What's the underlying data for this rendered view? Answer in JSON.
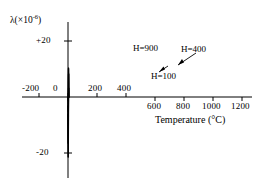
{
  "chart_data": {
    "type": "line",
    "title": "",
    "xlabel": "Temperature (°C)",
    "ylabel": "λ (×10⁻⁶)",
    "ylabel_symbol": "λ",
    "ylabel_factor": "(×10",
    "ylabel_exponent": "-6",
    "ylabel_close": ")",
    "xlim": [
      -260,
      1300
    ],
    "ylim": [
      -26,
      24
    ],
    "grid": false,
    "legend_position": "inline-annotations",
    "xticks": [
      -200,
      0,
      200,
      400,
      600,
      800,
      1000,
      1200
    ],
    "xticklabels": [
      "-200",
      "0",
      "200",
      "400",
      "600",
      "800",
      "1000",
      "1200"
    ],
    "xticklabel_above_axis": [
      true,
      true,
      true,
      true,
      false,
      false,
      false,
      false
    ],
    "yticks": [
      20,
      -20
    ],
    "yticklabels": [
      "+20",
      "-20"
    ],
    "series": [
      {
        "name": "H=900",
        "label": "H=900",
        "x": [
          -200,
          -150,
          -100,
          -50,
          0,
          60,
          120,
          180,
          230,
          270,
          310,
          350,
          400,
          440,
          480,
          520,
          560,
          620,
          680,
          740,
          800,
          860,
          920,
          980,
          1030,
          1070,
          1100,
          1140,
          1200,
          1260
        ],
        "y": [
          -6.2,
          -7.4,
          -9.0,
          -11.0,
          -13.2,
          -16.0,
          -18.6,
          -20.6,
          -21.4,
          -21.0,
          -19.2,
          -16.2,
          -11.0,
          -6.4,
          -2.4,
          1.6,
          5.0,
          8.4,
          10.0,
          10.4,
          10.0,
          9.0,
          7.4,
          5.0,
          3.0,
          1.2,
          0.3,
          0.0,
          0.0,
          0.0
        ]
      },
      {
        "name": "H=400",
        "label": "H=400",
        "x": [
          -200,
          -150,
          -100,
          -50,
          0,
          60,
          120,
          180,
          230,
          270,
          310,
          350,
          400,
          440,
          480,
          520,
          560,
          620,
          680,
          740,
          800,
          860,
          920,
          980,
          1030,
          1070,
          1100,
          1140,
          1200,
          1260
        ],
        "y": [
          -3.2,
          -4.0,
          -5.2,
          -6.8,
          -8.8,
          -11.4,
          -13.8,
          -15.6,
          -16.4,
          -16.2,
          -15.0,
          -12.8,
          -9.0,
          -5.4,
          -2.0,
          1.2,
          3.6,
          5.8,
          7.0,
          7.6,
          8.0,
          8.2,
          8.0,
          6.6,
          4.4,
          2.0,
          0.8,
          0.0,
          0.0,
          0.0
        ]
      },
      {
        "name": "H=100",
        "label": "H=100",
        "x": [
          -200,
          -150,
          -100,
          -50,
          0,
          60,
          120,
          180,
          230,
          270,
          310,
          350,
          400,
          440,
          480,
          520,
          560,
          620,
          680,
          740,
          800,
          860,
          920,
          980,
          1030,
          1070,
          1100,
          1140,
          1200,
          1260
        ],
        "y": [
          0.0,
          0.0,
          -0.1,
          -0.3,
          -0.6,
          -1.4,
          -2.8,
          -4.2,
          -5.0,
          -5.2,
          -5.0,
          -4.4,
          -3.2,
          -2.0,
          -1.0,
          -0.2,
          0.5,
          1.5,
          2.2,
          2.7,
          3.0,
          3.1,
          2.9,
          2.4,
          1.6,
          0.7,
          0.2,
          0.0,
          0.0,
          0.0
        ]
      }
    ],
    "annotations": [
      {
        "text": "H=900",
        "series": "H=900",
        "has_leader": false
      },
      {
        "text": "H=400",
        "series": "H=400",
        "has_leader": true
      },
      {
        "text": "H=100",
        "series": "H=100",
        "has_leader": true
      }
    ]
  }
}
